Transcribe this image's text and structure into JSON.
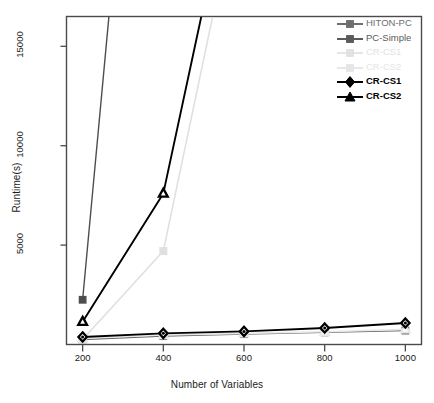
{
  "chart_data": {
    "type": "line",
    "title": "",
    "xlabel": "Number of Variables",
    "ylabel": "Runtime(s)",
    "x": [
      200,
      400,
      600,
      800,
      1000
    ],
    "xticks": [
      "200",
      "400",
      "600",
      "800",
      "1000"
    ],
    "yticks": [
      "5000",
      "10000",
      "15000"
    ],
    "xlim": [
      160,
      1040
    ],
    "ylim": [
      0,
      16500
    ],
    "grid": false,
    "legend_position": "top-right",
    "series": [
      {
        "name": "HITON-PC",
        "color": "#4d4d4d",
        "marker": "square",
        "faded": false,
        "values": [
          2250,
          46000,
          null,
          null,
          null
        ]
      },
      {
        "name": "PC-Simple",
        "color": "#666666",
        "marker": "square",
        "faded": false,
        "values": [
          250,
          420,
          520,
          610,
          700
        ]
      },
      {
        "name": "CR-CS1",
        "color": "#e0e0e0",
        "marker": "square",
        "faded": true,
        "values": [
          250,
          4700,
          24000,
          null,
          null
        ]
      },
      {
        "name": "CR-CS2",
        "color": "#e8e8e8",
        "marker": "triangle",
        "faded": true,
        "values": [
          300,
          480,
          560,
          640,
          760
        ]
      },
      {
        "name": "CR-CS1",
        "color": "#000000",
        "marker": "diamond",
        "faded": false,
        "values": [
          380,
          560,
          660,
          830,
          1080
        ]
      },
      {
        "name": "CR-CS2",
        "color": "#000000",
        "marker": "triangle",
        "faded": false,
        "values": [
          1150,
          7600,
          26500,
          null,
          null
        ]
      }
    ]
  },
  "legend": {
    "entries": [
      {
        "label": "HITON-PC",
        "color": "#6e6e6e",
        "faded": "false",
        "marker": "square"
      },
      {
        "label": "PC-Simple",
        "color": "#5a5a5a",
        "faded": "false",
        "marker": "square"
      },
      {
        "label": "CR-CS1",
        "color": "#e2e2e2",
        "faded": "true",
        "marker": "square"
      },
      {
        "label": "CR-CS2",
        "color": "#e6e6e6",
        "faded": "true",
        "marker": "square"
      },
      {
        "label": "CR-CS1",
        "color": "#000000",
        "faded": "false",
        "marker": "diamond"
      },
      {
        "label": "CR-CS2",
        "color": "#000000",
        "faded": "false",
        "marker": "triangle"
      }
    ]
  }
}
